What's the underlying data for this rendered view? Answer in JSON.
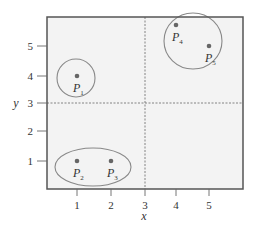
{
  "chart_data": {
    "type": "scatter",
    "title": "",
    "xlabel": "x",
    "ylabel": "y",
    "xlim": [
      0,
      6
    ],
    "ylim": [
      0,
      6
    ],
    "grid": false,
    "x_ticks": [
      1,
      2,
      3,
      4,
      5
    ],
    "y_ticks": [
      1,
      2,
      3,
      4,
      5
    ],
    "points": [
      {
        "name": "P1",
        "base": "P",
        "sub": "1",
        "x": 1,
        "y": 4
      },
      {
        "name": "P2",
        "base": "P",
        "sub": "2",
        "x": 1,
        "y": 1
      },
      {
        "name": "P3",
        "base": "P",
        "sub": "3",
        "x": 2,
        "y": 1
      },
      {
        "name": "P4",
        "base": "P",
        "sub": "4",
        "x": 4,
        "y": 5.7
      },
      {
        "name": "P5",
        "base": "P",
        "sub": "5",
        "x": 5,
        "y": 5
      }
    ],
    "reference_lines": [
      {
        "orientation": "vertical",
        "value": 3,
        "style": "dashed"
      },
      {
        "orientation": "horizontal",
        "value": 3,
        "style": "dashed"
      }
    ],
    "clusters": [
      {
        "name": "cluster-p1",
        "members": [
          "P1"
        ],
        "shape": "circle"
      },
      {
        "name": "cluster-p2-p3",
        "members": [
          "P2",
          "P3"
        ],
        "shape": "ellipse"
      },
      {
        "name": "cluster-p4-p5",
        "members": [
          "P4",
          "P5"
        ],
        "shape": "circle"
      }
    ]
  },
  "style": {
    "plot_background": "#f3f3f3",
    "frame_color": "#555555",
    "point_color": "#666666",
    "cluster_outline": "#888888",
    "reference_line_color": "#777777"
  }
}
